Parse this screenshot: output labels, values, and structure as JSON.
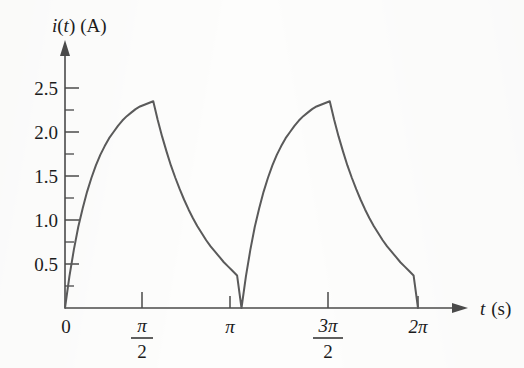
{
  "figure": {
    "background_color": "#fdfdfc",
    "curve_color": "#5a5a5a",
    "axis_color": "#4a4a4a",
    "label_color": "#1b1b1b"
  },
  "axes": {
    "y_title": "i(t) (A)",
    "y_title_symbol": "i",
    "y_title_variable": "t",
    "y_title_unit": "(A)",
    "x_title": "t (s)",
    "x_title_symbol": "t",
    "x_title_unit": "(s)"
  },
  "chart_data": {
    "type": "line",
    "title": "",
    "subtitle": "",
    "xlabel": "t (s)",
    "ylabel": "i(t) (A)",
    "grid": false,
    "legend": false,
    "legend_position": "none",
    "xlim": [
      0,
      7.2257
    ],
    "ylim": [
      0,
      2.75
    ],
    "x_tick_labels": [
      "0",
      "π/2",
      "π",
      "3π/2",
      "2π"
    ],
    "x_tick_values": [
      0,
      1.5708,
      3.1416,
      4.7124,
      6.2832
    ],
    "x_tick_display": [
      {
        "text": "0",
        "kind": "plain",
        "value": 0
      },
      {
        "numerator": "π",
        "denominator": "2",
        "kind": "fraction",
        "value": 1.5708
      },
      {
        "text": "π",
        "kind": "plain",
        "value": 3.1416
      },
      {
        "numerator": "3π",
        "denominator": "2",
        "kind": "fraction",
        "value": 4.7124
      },
      {
        "text": "2π",
        "kind": "plain",
        "value": 6.2832
      }
    ],
    "y_tick_labels": [
      "0.5",
      "1.0",
      "1.5",
      "2.0",
      "2.5"
    ],
    "y_tick_values": [
      0.5,
      1.0,
      1.5,
      2.0,
      2.5
    ],
    "y_minor_tick_values": [
      0.25,
      0.75,
      1.25,
      1.75,
      2.25
    ],
    "peak_value": 2.35,
    "period": 3.1416,
    "n_periods": 2,
    "waveform": "exponential rise then exponential decay, repeating each half-period of pi seconds",
    "series": [
      {
        "name": "i(t)",
        "color": "#5a5a5a",
        "x": [
          0,
          0.0785,
          0.1571,
          0.2356,
          0.3142,
          0.3927,
          0.4712,
          0.5498,
          0.6283,
          0.7069,
          0.7854,
          0.8639,
          0.9425,
          1.021,
          1.0996,
          1.1781,
          1.2566,
          1.3352,
          1.4137,
          1.4923,
          1.5708,
          1.5708,
          1.6493,
          1.7279,
          1.8064,
          1.885,
          1.9635,
          2.042,
          2.1206,
          2.1991,
          2.2777,
          2.3562,
          2.4347,
          2.5133,
          2.5918,
          2.6704,
          2.7489,
          2.8274,
          2.906,
          2.9845,
          3.0631,
          3.1416,
          3.1416,
          3.2201,
          3.2987,
          3.3772,
          3.4558,
          3.5343,
          3.6128,
          3.6914,
          3.7699,
          3.8485,
          3.927,
          4.0055,
          4.0841,
          4.1626,
          4.2412,
          4.3197,
          4.3982,
          4.4768,
          4.5553,
          4.6339,
          4.7124,
          4.7124,
          4.7909,
          4.8695,
          4.948,
          5.0265,
          5.1051,
          5.1836,
          5.2622,
          5.3407,
          5.4193,
          5.4978,
          5.5763,
          5.6549,
          5.7334,
          5.812,
          5.8905,
          5.969,
          6.0476,
          6.1261,
          6.2047,
          6.2832
        ],
        "y": [
          0,
          0.36,
          0.66,
          0.92,
          1.13,
          1.32,
          1.48,
          1.62,
          1.74,
          1.84,
          1.93,
          2.0,
          2.07,
          2.13,
          2.18,
          2.22,
          2.26,
          2.29,
          2.31,
          2.33,
          2.35,
          2.35,
          2.14,
          1.95,
          1.78,
          1.62,
          1.48,
          1.35,
          1.23,
          1.12,
          1.02,
          0.93,
          0.85,
          0.77,
          0.7,
          0.64,
          0.58,
          0.52,
          0.47,
          0.42,
          0.37,
          0.0,
          0.0,
          0.36,
          0.66,
          0.92,
          1.13,
          1.32,
          1.48,
          1.62,
          1.74,
          1.84,
          1.93,
          2.0,
          2.07,
          2.13,
          2.18,
          2.22,
          2.26,
          2.29,
          2.31,
          2.33,
          2.35,
          2.35,
          2.14,
          1.95,
          1.78,
          1.62,
          1.48,
          1.35,
          1.23,
          1.12,
          1.02,
          0.93,
          0.85,
          0.77,
          0.7,
          0.64,
          0.58,
          0.52,
          0.47,
          0.42,
          0.37,
          0.0
        ]
      }
    ]
  }
}
